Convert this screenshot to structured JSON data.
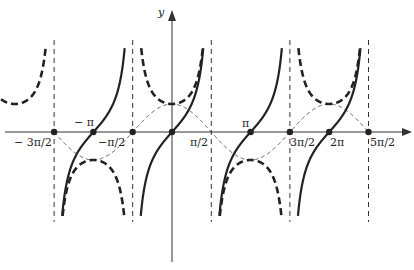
{
  "diagram": {
    "axis_y_label": "y",
    "tick_labels": [
      "-3π/2",
      "-π",
      "-π/2",
      "π/2",
      "π",
      "3π/2",
      "2π",
      "5π/2"
    ],
    "labels": {
      "y": "y",
      "neg3pi2": "− 3π/2",
      "negpi": "− π",
      "negpi2": "−π/2",
      "pi2": "π/2",
      "pi": "π",
      "threepi2": "3π/2",
      "twopi": "2π",
      "fivepi2": "5π/2"
    },
    "colors": {
      "curve": "#222222",
      "axis": "#333333"
    }
  }
}
